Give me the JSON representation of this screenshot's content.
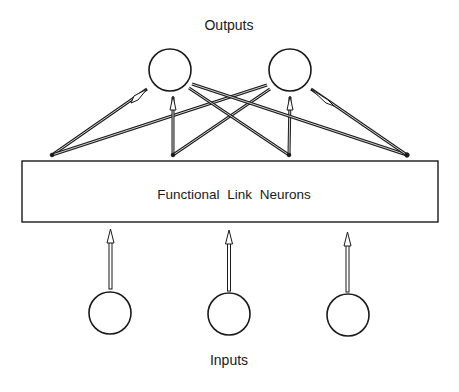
{
  "labels": {
    "outputs": "Outputs",
    "inputs": "Inputs",
    "layer": "Functional Link Neurons"
  },
  "nodes": {
    "outputs": [
      {
        "id": "output-1",
        "cx": 170,
        "cy": 70,
        "r": 21
      },
      {
        "id": "output-2",
        "cx": 290,
        "cy": 70,
        "r": 21
      }
    ],
    "inputs": [
      {
        "id": "input-1",
        "cx": 110,
        "cy": 313,
        "r": 21
      },
      {
        "id": "input-2",
        "cx": 229,
        "cy": 314,
        "r": 21
      },
      {
        "id": "input-3",
        "cx": 348,
        "cy": 315,
        "r": 21
      }
    ],
    "layer_box": {
      "x": 22,
      "y": 161,
      "width": 416,
      "height": 61
    }
  },
  "edges": {
    "input_to_layer": [
      "input-1 -> layer",
      "input-2 -> layer",
      "input-3 -> layer"
    ],
    "layer_to_output": [
      "layer(52) -> output-1",
      "layer(52) -> output-2",
      "layer(173) -> output-1",
      "layer(173) -> output-2",
      "layer(289) -> output-1",
      "layer(289) -> output-2",
      "layer(407) -> output-1",
      "layer(407) -> output-2"
    ]
  },
  "colors": {
    "stroke": "#1a1a1a",
    "background": "#ffffff"
  }
}
